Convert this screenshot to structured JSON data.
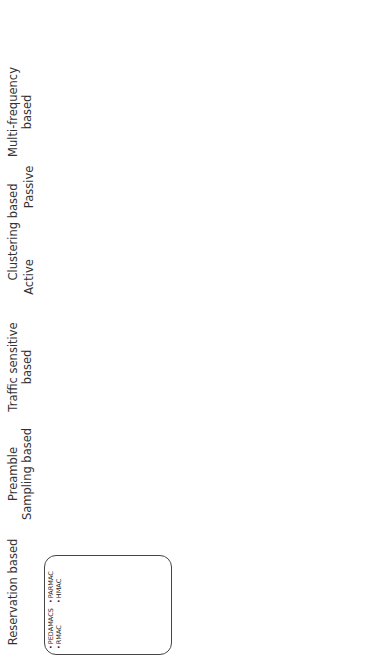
{
  "categories": [
    {
      "key": "reservation",
      "title": "Reservation based",
      "groups": [
        [
          "PEDAMACS",
          "RMAC"
        ],
        [
          "PARMAC",
          "HMAC"
        ]
      ]
    },
    {
      "key": "preamble",
      "title": "Preamble Sampling based",
      "groups": [
        [
          "X-MAC",
          "MH-AC",
          "CMAC",
          "WiseMAC",
          "RATE EST"
        ],
        [
          "1-hop MAC",
          "GeRAF",
          "MH-MAC",
          "Funneling MAC",
          "SCP-MAC",
          "CrankShaft"
        ]
      ]
    },
    {
      "key": "traffic",
      "title": "Traffic sensitive based",
      "groups": [
        [
          "FLAMA",
          "μMAC",
          "ZMAC"
        ],
        [
          "U-MAC",
          "RL-MAC",
          "Multi-Channel",
          "LMAC",
          "MH-MAC",
          "Funneling MAC"
        ]
      ]
    },
    {
      "key": "active",
      "title": "Active",
      "groups": [
        [
          "Wavenis"
        ],
        [
          "GANGS"
        ]
      ]
    },
    {
      "key": "passive",
      "title": "Passive",
      "groups": [
        [
          "BMA"
        ],
        []
      ]
    },
    {
      "key": "multifreq",
      "title": "Multi-frequency based",
      "groups": [
        [
          "f-MAC",
          "MMSN"
        ],
        [
          "HyMAC",
          "TMCP",
          "TSMP"
        ]
      ]
    },
    {
      "key": "slotted",
      "title": "Slotted contention based",
      "groups": [
        [
          "MERLIN"
        ],
        [
          "SCP-MAC",
          "CrankShaft"
        ]
      ]
    },
    {
      "key": "multichannel",
      "title": "Multi-channel based",
      "groups": [
        [
          "Y-MAC"
        ],
        []
      ]
    }
  ],
  "clustering_header": "Clustering based",
  "side_labels": {
    "individual": "Individual",
    "multiple": "Multiple"
  },
  "multiple": {
    "blocks": {
      "mh_mac_a": "MH-MAC",
      "funneling_a": "Funneling MAC",
      "scp_mac_a": "SCP-MAC",
      "crankshaft_a": "CrankShaft",
      "mh_mac_b": "MH-MAC",
      "funneling_b": "Funneling MAC",
      "u_mac": "U-MAC",
      "rl_mac": "RL-MAC",
      "mc_lmac": "Multi-Channel LMAC",
      "onehop": "1-hop MAC",
      "geraf": "GeRAF",
      "scp_mac_b": "SCP-MAC",
      "crankshaft_b": "CrankShaft",
      "tsmp": "TSMP",
      "merlin": "MERLIN"
    },
    "relations": {
      "scheduled": "(Scheduled)",
      "cross_layer": "(Cross-Layer)",
      "cross": "(Cross-",
      "layer": "Layer)"
    }
  }
}
